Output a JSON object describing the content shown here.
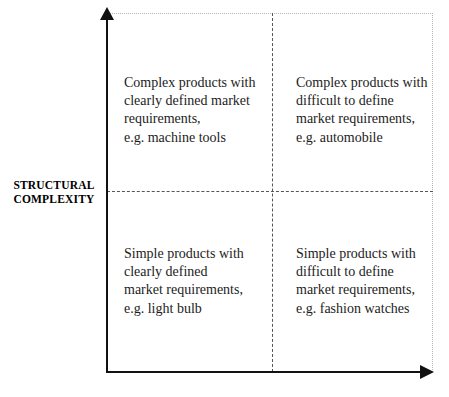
{
  "figure": {
    "y_axis_label_line1": "STRUCTURAL",
    "y_axis_label_line2": "COMPLEXITY",
    "colors": {
      "axis": "#111111",
      "divider": "#555555",
      "border": "#b4b4b4",
      "text": "#1c1c1c",
      "background": "#ffffff"
    }
  },
  "quadrants": {
    "top_left": {
      "text": "Complex products with\nclearly defined market\nrequirements,\ne.g. machine tools",
      "lines": [
        "Complex products with",
        "clearly defined market",
        "requirements,",
        "e.g. machine tools"
      ],
      "example": "machine tools"
    },
    "top_right": {
      "text": "Complex products with\ndifficult to define\nmarket requirements,\ne.g. automobile",
      "lines": [
        "Complex products with",
        "difficult to define",
        "market requirements,",
        "e.g. automobile"
      ],
      "example": "automobile"
    },
    "bottom_left": {
      "text": "Simple products with\nclearly defined\nmarket requirements,\ne.g. light bulb",
      "lines": [
        "Simple products with",
        "clearly defined",
        "market requirements,",
        "e.g. light bulb"
      ],
      "example": "light bulb"
    },
    "bottom_right": {
      "text": "Simple products with\ndifficult to define\nmarket requirements,\ne.g. fashion watches",
      "lines": [
        "Simple products with",
        "difficult to define",
        "market requirements,",
        "e.g. fashion watches"
      ],
      "example": "fashion watches"
    }
  },
  "chart_data": {
    "type": "table",
    "xlabel": "",
    "ylabel": "STRUCTURAL COMPLEXITY",
    "grid": false,
    "legend": "none",
    "axis_arrows": [
      "y-up",
      "x-right"
    ],
    "divider_style": "dashed",
    "rows": [
      "Complex",
      "Simple"
    ],
    "columns": [
      "Clearly defined market requirements",
      "Difficult to define market requirements"
    ],
    "cells": [
      [
        "Complex products with clearly defined market requirements, e.g. machine tools",
        "Complex products with difficult to define market requirements, e.g. automobile"
      ],
      [
        "Simple products with clearly defined market requirements, e.g. light bulb",
        "Simple products with difficult to define market requirements, e.g. fashion watches"
      ]
    ]
  }
}
